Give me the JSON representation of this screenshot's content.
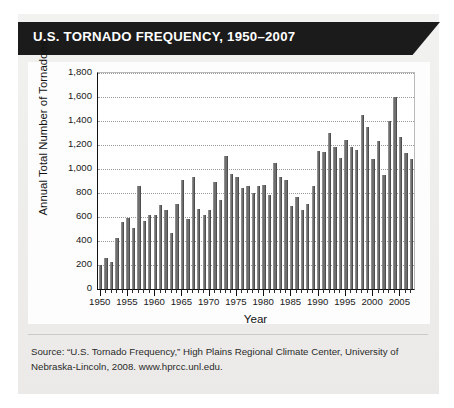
{
  "banner": {
    "title": "U.S. TORNADO FREQUENCY, 1950–2007",
    "background": "#1b1b1b",
    "text_color": "#ffffff"
  },
  "source_note": "Source: “U.S. Tornado Frequency,” High Plains Regional Climate Center, University of Nebraska-Lincoln, 2008. www.hprcc.unl.edu.",
  "axis": {
    "y_title": "Annual Total Number of Tornadoes",
    "x_title": "Year",
    "y_ticks": [
      "0",
      "200",
      "400",
      "600",
      "800",
      "1,000",
      "1,200",
      "1,400",
      "1,600",
      "1,800"
    ],
    "x_ticks": [
      "1950",
      "1955",
      "1960",
      "1965",
      "1970",
      "1975",
      "1980",
      "1985",
      "1990",
      "1995",
      "2000",
      "2005"
    ]
  },
  "colors": {
    "bar_fill": "#6f6f6f",
    "grid": "#9a9a9a",
    "axis": "#111111",
    "page": "#eeeeec"
  },
  "chart_data": {
    "type": "bar",
    "title": "U.S. TORNADO FREQUENCY, 1950–2007",
    "xlabel": "Year",
    "ylabel": "Annual Total Number of Tornadoes",
    "ylim": [
      0,
      1800
    ],
    "ytick_step": 200,
    "grid": true,
    "legend": "none",
    "categories": [
      1950,
      1951,
      1952,
      1953,
      1954,
      1955,
      1956,
      1957,
      1958,
      1959,
      1960,
      1961,
      1962,
      1963,
      1964,
      1965,
      1966,
      1967,
      1968,
      1969,
      1970,
      1971,
      1972,
      1973,
      1974,
      1975,
      1976,
      1977,
      1978,
      1979,
      1980,
      1981,
      1982,
      1983,
      1984,
      1985,
      1986,
      1987,
      1988,
      1989,
      1990,
      1991,
      1992,
      1993,
      1994,
      1995,
      1996,
      1997,
      1998,
      1999,
      2000,
      2001,
      2002,
      2003,
      2004,
      2005,
      2006,
      2007
    ],
    "values": [
      200,
      255,
      225,
      425,
      560,
      595,
      505,
      860,
      570,
      615,
      620,
      700,
      660,
      470,
      710,
      910,
      580,
      930,
      670,
      620,
      660,
      890,
      745,
      1110,
      960,
      930,
      840,
      860,
      800,
      860,
      870,
      780,
      1050,
      930,
      910,
      690,
      770,
      660,
      705,
      860,
      1150,
      1140,
      1300,
      1180,
      1090,
      1240,
      1180,
      1160,
      1450,
      1350,
      1080,
      1230,
      950,
      1400,
      1600,
      1270,
      1130,
      1080
    ]
  }
}
